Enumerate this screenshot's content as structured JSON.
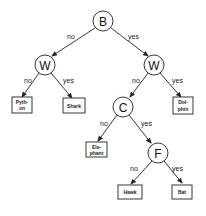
{
  "diagram": {
    "type": "decision-tree",
    "nodes": {
      "root": {
        "label": "B"
      },
      "w_left": {
        "label": "W"
      },
      "w_right": {
        "label": "W"
      },
      "c": {
        "label": "C"
      },
      "f": {
        "label": "F"
      }
    },
    "leaves": {
      "python": {
        "line1": "Pyth-",
        "line2": "on"
      },
      "shark": {
        "line1": "Shark"
      },
      "dolphin": {
        "line1": "Dol-",
        "line2": "phin"
      },
      "elephant": {
        "line1": "Ele-",
        "line2": "phant"
      },
      "hawk": {
        "line1": "Hawk"
      },
      "bat": {
        "line1": "Bat"
      }
    },
    "edges": {
      "root_no": "no",
      "root_yes": "yes",
      "wl_no": "no",
      "wl_yes": "yes",
      "wr_no": "no",
      "wr_yes": "yes",
      "c_no": "no",
      "c_yes": "yes",
      "f_no": "no",
      "f_yes": "yes"
    }
  }
}
